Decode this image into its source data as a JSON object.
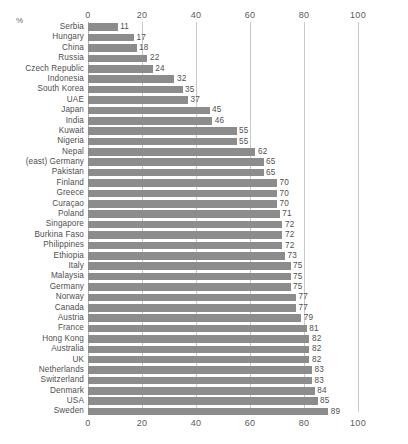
{
  "axis": {
    "percent_symbol": "%",
    "ticks": [
      "0",
      "20",
      "40",
      "60",
      "80",
      "100"
    ],
    "tick_values": [
      0,
      20,
      40,
      60,
      80,
      100
    ]
  },
  "chart_data": {
    "type": "bar",
    "orientation": "horizontal",
    "title": "",
    "subtitle": "",
    "xlabel": "%",
    "ylabel": "",
    "xlim": [
      0,
      100
    ],
    "grid": true,
    "legend": "none",
    "series_name": "",
    "bar_color": "#8c8c8c",
    "categories": [
      "Serbia",
      "Hungary",
      "China",
      "Russia",
      "Czech Republic",
      "Indonesia",
      "South Korea",
      "UAE",
      "Japan",
      "India",
      "Kuwait",
      "Nigeria",
      "Nepal",
      "(east) Germany",
      "Pakistan",
      "Finland",
      "Greece",
      "Curaçao",
      "Poland",
      "Singapore",
      "Burkina Faso",
      "Philippines",
      "Ethiopia",
      "Italy",
      "Malaysia",
      "Germany",
      "Norway",
      "Canada",
      "Austria",
      "France",
      "Hong Kong",
      "Australia",
      "UK",
      "Netherlands",
      "Switzerland",
      "Denmark",
      "USA",
      "Sweden"
    ],
    "values": [
      11,
      17,
      18,
      22,
      24,
      32,
      35,
      37,
      45,
      46,
      55,
      55,
      62,
      65,
      65,
      70,
      70,
      70,
      71,
      72,
      72,
      72,
      73,
      75,
      75,
      75,
      77,
      77,
      79,
      81,
      82,
      82,
      82,
      83,
      83,
      84,
      85,
      89
    ],
    "value_labels": [
      "11",
      "17",
      "18",
      "22",
      "24",
      "32",
      "35",
      "37",
      "45",
      "46",
      "55",
      "55",
      "62",
      "65",
      "65",
      "70",
      "70",
      "70",
      "71",
      "72",
      "72",
      "72",
      "73",
      "75",
      "75",
      "75",
      "77",
      "77",
      "79",
      "81",
      "82",
      "82",
      "82",
      "83",
      "83",
      "84",
      "85",
      "89"
    ]
  }
}
